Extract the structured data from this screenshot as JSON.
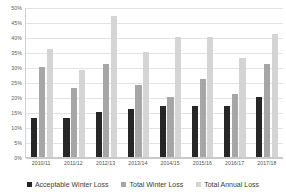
{
  "chart_data": {
    "type": "bar",
    "title": "",
    "xlabel": "",
    "ylabel": "",
    "ylim": [
      0,
      50
    ],
    "y_tick_step": 5,
    "y_unit": "%",
    "grid": true,
    "legend_position": "bottom",
    "categories": [
      "2010/11",
      "2011/12",
      "2012/13",
      "2013/14",
      "2014/15",
      "2015/16",
      "2016/17",
      "2017/18"
    ],
    "y_ticks": [
      "0%",
      "5%",
      "10%",
      "15%",
      "20%",
      "25%",
      "30%",
      "35%",
      "40%",
      "45%",
      "50%"
    ],
    "series": [
      {
        "name": "Acceptable Winter Loss",
        "color": "#262626",
        "values": [
          13,
          13,
          15,
          16,
          17,
          17,
          17,
          20
        ]
      },
      {
        "name": "Total Winter Loss",
        "color": "#a6a6a6",
        "values": [
          30,
          23,
          31,
          24,
          20,
          26,
          21,
          31
        ]
      },
      {
        "name": "Total Annual Loss",
        "color": "#d4d4d4",
        "values": [
          36,
          29,
          47,
          35,
          40,
          40,
          33,
          41
        ]
      }
    ]
  }
}
